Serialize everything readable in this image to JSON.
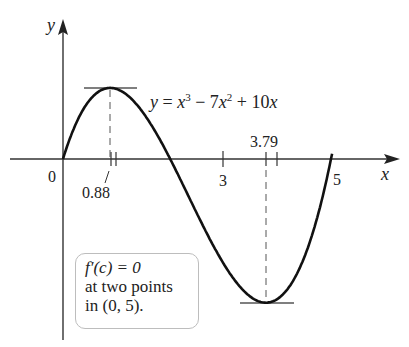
{
  "figure": {
    "axis_labels": {
      "x": "x",
      "y": "y"
    },
    "origin_label": "0",
    "tick_labels": {
      "x3": "3",
      "x5": "5"
    },
    "critical_points": [
      {
        "label": "0.88",
        "x": 0.88,
        "type": "local max"
      },
      {
        "label": "3.79",
        "x": 3.79,
        "type": "local min"
      }
    ],
    "equation": "y = x³ − 7x² + 10x",
    "annotation": {
      "line1": "f′(c) = 0",
      "line2": "at two points",
      "line3": "in (0, 5)."
    },
    "colors": {
      "curve": "#111111",
      "axis": "#333333",
      "tangent": "#555555",
      "box_border": "#bdbdbd"
    }
  }
}
